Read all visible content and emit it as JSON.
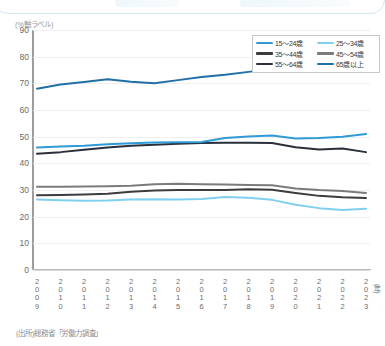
{
  "y_axis_label": "(%軸ラベル)",
  "x_axis_unit": "(年)",
  "source_note": "(出所)総務省「労働力調査」",
  "legend": {
    "items": [
      {
        "label": "15～24歳",
        "color": "#2e9bd6"
      },
      {
        "label": "25～34歳",
        "color": "#7fd0f0"
      },
      {
        "label": "35～44歳",
        "color": "#3c3c3c"
      },
      {
        "label": "45～54歳",
        "color": "#7b7b7b"
      },
      {
        "label": "55～64歳",
        "color": "#2a2f3a"
      },
      {
        "label": "65歳以上",
        "color": "#1f6fa8"
      }
    ]
  },
  "chart_data": {
    "type": "line",
    "title": "",
    "xlabel": "(年)",
    "ylabel": "(%軸ラベル)",
    "ylim": [
      0,
      90
    ],
    "ytick_step": 10,
    "yticks": [
      0,
      10,
      20,
      30,
      40,
      50,
      60,
      70,
      80,
      90
    ],
    "grid": true,
    "legend_position": "top-right",
    "categories": [
      "2009",
      "2010",
      "2011",
      "2012",
      "2013",
      "2014",
      "2015",
      "2016",
      "2017",
      "2018",
      "2019",
      "2020",
      "2021",
      "2022",
      "2023"
    ],
    "series": [
      {
        "name": "65歳以上",
        "color": "#1f6fa8",
        "values": [
          68.0,
          69.6,
          70.5,
          71.5,
          70.6,
          70.0,
          71.2,
          72.4,
          73.2,
          74.3,
          75.3,
          75.6,
          75.8,
          76.4,
          77.3
        ]
      },
      {
        "name": "15～24歳",
        "color": "#2e9bd6",
        "values": [
          45.9,
          46.3,
          46.6,
          47.2,
          47.5,
          47.8,
          47.9,
          48.0,
          49.5,
          50.1,
          50.4,
          49.3,
          49.5,
          50.0,
          51.0
        ]
      },
      {
        "name": "55～64歳",
        "color": "#2a2f3a",
        "values": [
          43.6,
          44.2,
          45.1,
          45.9,
          46.6,
          47.0,
          47.3,
          47.6,
          47.7,
          47.7,
          47.6,
          46.0,
          45.2,
          45.6,
          44.2
        ]
      },
      {
        "name": "45～54歳",
        "color": "#7b7b7b",
        "values": [
          31.2,
          31.2,
          31.3,
          31.4,
          31.6,
          32.2,
          32.3,
          32.2,
          32.1,
          31.9,
          31.8,
          30.6,
          30.0,
          29.6,
          28.9
        ]
      },
      {
        "name": "35～44歳",
        "color": "#3c3c3c",
        "values": [
          28.0,
          28.1,
          28.3,
          28.6,
          29.3,
          29.8,
          30.0,
          30.0,
          30.0,
          30.3,
          30.1,
          28.9,
          27.8,
          27.3,
          27.0
        ]
      },
      {
        "name": "25～34歳",
        "color": "#7fd0f0",
        "values": [
          26.4,
          26.2,
          26.0,
          26.1,
          26.4,
          26.5,
          26.4,
          26.6,
          27.4,
          27.1,
          26.3,
          24.5,
          23.2,
          22.5,
          23.0
        ]
      }
    ]
  }
}
